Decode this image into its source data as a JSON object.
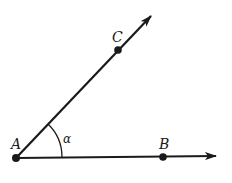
{
  "figure": {
    "points": {
      "A": {
        "label": "A",
        "x": 16,
        "y": 158
      },
      "B": {
        "label": "B",
        "x": 163,
        "y": 157
      },
      "C": {
        "label": "C",
        "x": 118,
        "y": 50
      }
    },
    "angle_label": "α",
    "colors": {
      "stroke": "#1a1a1a",
      "background": "#ffffff"
    }
  }
}
